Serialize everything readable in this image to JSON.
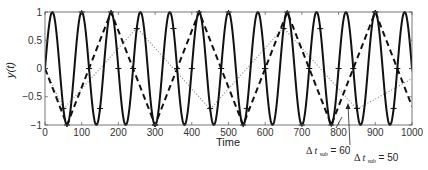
{
  "chart_data": {
    "type": "line",
    "title": "",
    "xlabel": "Time",
    "ylabel": "y(t)",
    "xlim": [
      0,
      1000
    ],
    "ylim": [
      -1,
      1
    ],
    "grid": false,
    "legend": null,
    "x_ticks": [
      "0",
      "100",
      "200",
      "300",
      "400",
      "500",
      "600",
      "700",
      "800",
      "900",
      "1000"
    ],
    "y_ticks": [
      "1",
      "0.5",
      "0",
      "-0.5",
      "-1"
    ],
    "series": [
      {
        "name": "y(t) continuous signal",
        "style": "solid",
        "function": "sin(2*pi*t/80)",
        "period": 80,
        "x_range": [
          0,
          1000
        ]
      },
      {
        "name": "sampled, Δt_sub = 60",
        "style": "dashed",
        "x": [
          0,
          60,
          120,
          180,
          240,
          300,
          360,
          420,
          480,
          540,
          600,
          660,
          720,
          780,
          840,
          900,
          960,
          1000
        ],
        "values": [
          0,
          -1,
          0,
          1,
          0,
          -1,
          0,
          1,
          0,
          -1,
          0,
          1,
          0,
          -1,
          0,
          1,
          0,
          -0.67
        ]
      },
      {
        "name": "sampled, Δt_sub = 50",
        "style": "dotted",
        "x": [
          0,
          50,
          250,
          450,
          650,
          850,
          1000
        ],
        "values": [
          0,
          -0.72,
          0.72,
          -0.72,
          0.72,
          -0.72,
          -0.18
        ]
      }
    ],
    "annotations": [
      {
        "text": "Δ t_sub = 60",
        "arrow_to": [
          770,
          -0.85
        ]
      },
      {
        "text": "Δ t_sub = 50",
        "arrow_to": [
          828,
          -0.7
        ]
      }
    ]
  },
  "axes": {
    "xlabel": "Time",
    "ylabel": "y(t)"
  },
  "annotations": {
    "a60": {
      "delta": "Δ",
      "t": "t",
      "sub": "sub",
      "eq": "= 60"
    },
    "a50": {
      "delta": "Δ",
      "t": "t",
      "sub": "sub",
      "eq": "= 50"
    }
  }
}
